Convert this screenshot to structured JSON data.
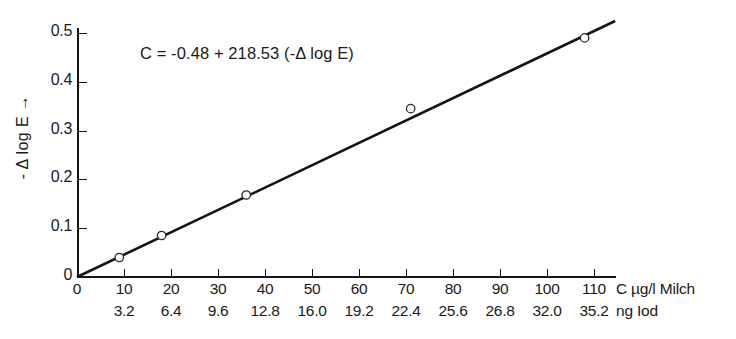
{
  "figure": {
    "background_color": "#ffffff",
    "ink_color": "#141414"
  },
  "equation": {
    "text": "C = -0.48 + 218.53 (-Δ log E)",
    "parts": {
      "lhs": "C",
      "equals": "=",
      "intercept": "-0.48",
      "plus": "+",
      "slope": "218.53",
      "term": "(-Δ log E)"
    }
  },
  "y_axis": {
    "title": "- Δ log E",
    "arrow": "→",
    "ticks": [
      "0.5",
      "0.4",
      "0.3",
      "0.2",
      "0.1",
      "0"
    ],
    "tick_values": [
      0.5,
      0.4,
      0.3,
      0.2,
      0.1,
      0.0
    ],
    "min": 0.0,
    "max": 0.52
  },
  "x_axis_primary": {
    "unit_label": "C µg/l Milch",
    "ticks": [
      "0",
      "10",
      "20",
      "30",
      "40",
      "50",
      "60",
      "70",
      "80",
      "90",
      "100",
      "110"
    ],
    "tick_values": [
      0,
      10,
      20,
      30,
      40,
      50,
      60,
      70,
      80,
      90,
      100,
      110
    ],
    "min": 0,
    "max": 114.5
  },
  "x_axis_secondary": {
    "unit_label": "ng Iod",
    "ticks": [
      "3.2",
      "6.4",
      "9.6",
      "12.8",
      "16.0",
      "19.2",
      "22.4",
      "25.6",
      "26.8",
      "32.0",
      "35.2"
    ],
    "tick_values": [
      3.2,
      6.4,
      9.6,
      12.8,
      16.0,
      19.2,
      22.4,
      25.6,
      26.8,
      32.0,
      35.2
    ],
    "aligned_to_primary": [
      10,
      20,
      30,
      40,
      50,
      60,
      70,
      80,
      90,
      100,
      110
    ]
  },
  "chart_data": {
    "type": "scatter",
    "title": "",
    "subtitle": "",
    "xlabel": "C µg/l Milch",
    "ylabel": "- Δ log E",
    "xlim": [
      0,
      114.5
    ],
    "ylim": [
      0,
      0.52
    ],
    "grid": false,
    "legend": null,
    "annotations": [
      {
        "text": "C = -0.48 + 218.53 (-Δ log E)",
        "x": 30,
        "y": 0.455
      }
    ],
    "series": [
      {
        "name": "measurements",
        "type": "scatter",
        "marker": "open-circle",
        "x": [
          9.0,
          18.0,
          36.0,
          71.0,
          108.0
        ],
        "y": [
          0.04,
          0.085,
          0.168,
          0.345,
          0.49
        ]
      },
      {
        "name": "regression-line",
        "type": "line",
        "x": [
          0,
          114.5
        ],
        "y": [
          0.0,
          0.5245
        ],
        "slope_y_per_x": 0.00458,
        "intercept": 0.0
      }
    ]
  }
}
